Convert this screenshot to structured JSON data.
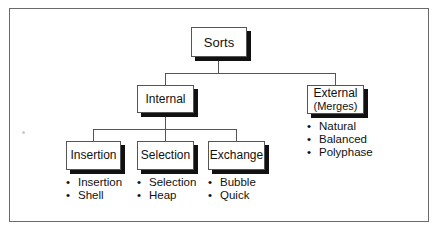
{
  "diagram": {
    "type": "hierarchy",
    "root": {
      "label": "Sorts"
    },
    "level1": [
      {
        "label": "Internal"
      },
      {
        "label": "External",
        "sublabel": "(Merges)",
        "items": [
          "Natural",
          "Balanced",
          "Polyphase"
        ]
      }
    ],
    "level2": [
      {
        "label": "Insertion",
        "items": [
          "Insertion",
          "Shell"
        ]
      },
      {
        "label": "Selection",
        "items": [
          "Selection",
          "Heap"
        ]
      },
      {
        "label": "Exchange",
        "items": [
          "Bubble",
          "Quick"
        ]
      }
    ]
  }
}
